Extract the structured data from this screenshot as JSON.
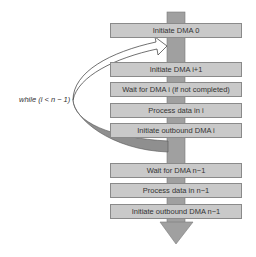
{
  "diagram": {
    "loop_label": "while (i < n − 1)",
    "boxes": [
      {
        "label": "Initiate DMA 0",
        "top": 23
      },
      {
        "label": "Initiate DMA i+1",
        "top": 62
      },
      {
        "label": "Wait for DMA i (if not completed)",
        "top": 82
      },
      {
        "label": "Process data in i",
        "top": 103
      },
      {
        "label": "Initiate outbound DMA i",
        "top": 123
      },
      {
        "label": "Wait for DMA n−1",
        "top": 163
      },
      {
        "label": "Process data in n−1",
        "top": 183
      },
      {
        "label": "Initiate outbound DMA n−1",
        "top": 204
      }
    ],
    "colors": {
      "box_fill": "#c9c9c9",
      "stem": "#9a9a9a",
      "loop_shadow": "#8f8f8f"
    }
  }
}
